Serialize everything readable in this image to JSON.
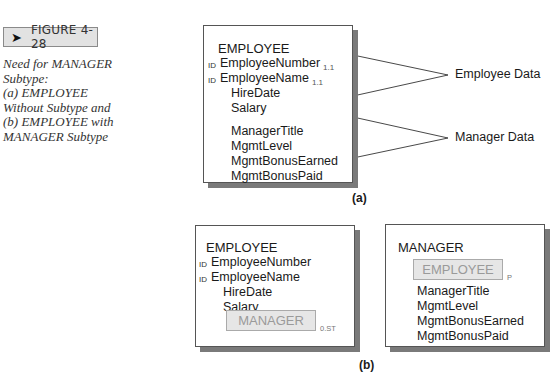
{
  "figure": {
    "arrow_icon": "➤",
    "number": "FIGURE 4-28",
    "caption_lines": [
      "Need for MANAGER",
      "Subtype:",
      "(a) EMPLOYEE",
      "Without Subtype and",
      "(b) EMPLOYEE with",
      "MANAGER Subtype"
    ]
  },
  "part_a": {
    "label": "(a)",
    "entity": {
      "name": "EMPLOYEE",
      "attributes": [
        {
          "id": "ID",
          "name": "EmployeeNumber",
          "sub": "1.1"
        },
        {
          "id": "ID",
          "name": "EmployeeName",
          "sub": "1.1"
        },
        {
          "id": "",
          "name": "HireDate",
          "sub": ""
        },
        {
          "id": "",
          "name": "Salary",
          "sub": ""
        },
        {
          "id": "",
          "name": "ManagerTitle",
          "sub": ""
        },
        {
          "id": "",
          "name": "MgmtLevel",
          "sub": ""
        },
        {
          "id": "",
          "name": "MgmtBonusEarned",
          "sub": ""
        },
        {
          "id": "",
          "name": "MgmtBonusPaid",
          "sub": ""
        }
      ]
    },
    "groups": [
      {
        "label": "Employee Data"
      },
      {
        "label": "Manager Data"
      }
    ]
  },
  "part_b": {
    "label": "(b)",
    "employee": {
      "name": "EMPLOYEE",
      "attributes": [
        {
          "id": "ID",
          "name": "EmployeeNumber"
        },
        {
          "id": "ID",
          "name": "EmployeeName"
        },
        {
          "id": "",
          "name": "HireDate"
        },
        {
          "id": "",
          "name": "Salary"
        }
      ],
      "subtype_box": {
        "label": "MANAGER",
        "cardinality": "0.ST"
      }
    },
    "manager": {
      "name": "MANAGER",
      "supertype_box": {
        "label": "EMPLOYEE",
        "cardinality": "P"
      },
      "attributes": [
        {
          "name": "ManagerTitle"
        },
        {
          "name": "MgmtLevel"
        },
        {
          "name": "MgmtBonusEarned"
        },
        {
          "name": "MgmtBonusPaid"
        }
      ]
    }
  }
}
